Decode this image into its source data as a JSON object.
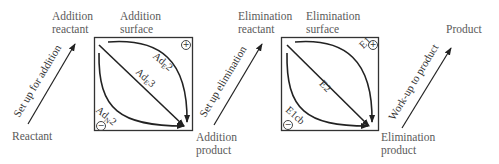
{
  "diagram": {
    "stages": {
      "reactant": "Reactant",
      "addition_reactant": [
        "Addition",
        "reactant"
      ],
      "addition_surface": [
        "Addition",
        "surface"
      ],
      "addition_product": [
        "Addition",
        "product"
      ],
      "elimination_reactant": [
        "Elimination",
        "reactant"
      ],
      "elimination_surface": [
        "Elimination",
        "surface"
      ],
      "elimination_product": [
        "Elimination",
        "product"
      ],
      "product": "Product"
    },
    "transitions": {
      "set_up_addition": "Set up for addition",
      "set_up_elimination": "Set up elimination",
      "work_up": "Work-up to product"
    },
    "addition_box": {
      "top_path": {
        "main": "Ad",
        "sub": "E",
        "num": "2",
        "charge": "+"
      },
      "diagonal_path": {
        "main": "Ad",
        "sub": "E",
        "num": "3"
      },
      "bottom_path": {
        "main": "Ad",
        "sub": "N",
        "num": "2",
        "charge": "−"
      }
    },
    "elimination_box": {
      "top_path": {
        "label": "E1",
        "charge": "+"
      },
      "diagonal_path": {
        "label": "E2"
      },
      "bottom_path": {
        "label": "E1cb",
        "charge": "−"
      }
    },
    "colors": {
      "line": "#222222",
      "text": "#5a5a5a",
      "background": "#ffffff"
    }
  }
}
